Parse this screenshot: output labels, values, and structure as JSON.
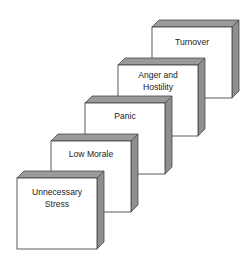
{
  "diagram": {
    "type": "stacked-3d-steps",
    "colors": {
      "face": "#ffffff",
      "edge": "#4a4a4a",
      "side": "#8f8f8f",
      "top": "#9a9a9a"
    },
    "steps": [
      {
        "label_lines": [
          "Unnecessary",
          "Stress"
        ],
        "x": 17,
        "y": 178
      },
      {
        "label_lines": [
          "Low Morale"
        ],
        "x": 51,
        "y": 141
      },
      {
        "label_lines": [
          "Panic"
        ],
        "x": 85,
        "y": 103
      },
      {
        "label_lines": [
          "Anger and",
          "Hostility"
        ],
        "x": 118,
        "y": 65
      },
      {
        "label_lines": [
          "Turnover"
        ],
        "x": 152,
        "y": 27
      }
    ]
  }
}
